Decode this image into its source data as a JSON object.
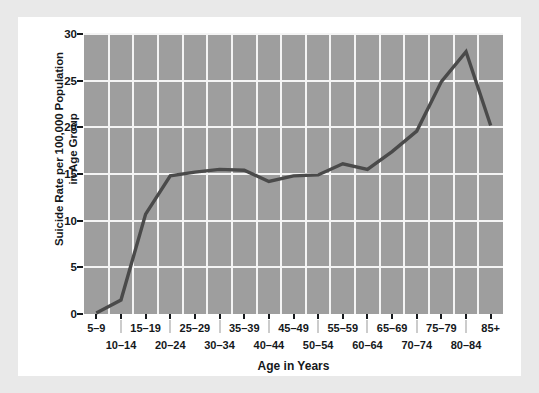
{
  "chart_data": {
    "type": "line",
    "title": "",
    "subtitle": "",
    "xlabel": "Age in Years",
    "ylabel": "Suicide Rate per 100,000 Population\nin Age Group",
    "ylabel_line1": "Suicide Rate per 100,000 Population",
    "ylabel_line2": "in Age Group",
    "categories": [
      "5–9",
      "10–14",
      "15–19",
      "20–24",
      "25–29",
      "30–34",
      "35–39",
      "40–44",
      "45–49",
      "50–54",
      "55–59",
      "60–64",
      "65–69",
      "70–74",
      "75–79",
      "80–84",
      "85+"
    ],
    "values": [
      0.1,
      1.5,
      10.7,
      14.8,
      15.2,
      15.5,
      15.4,
      14.2,
      14.8,
      14.9,
      16.1,
      15.5,
      17.4,
      19.6,
      24.9,
      28.1,
      20.2
    ],
    "series": [
      {
        "name": "Suicide rate",
        "values": [
          0.1,
          1.5,
          10.7,
          14.8,
          15.2,
          15.5,
          15.4,
          14.2,
          14.8,
          14.9,
          16.1,
          15.5,
          17.4,
          19.6,
          24.9,
          28.1,
          20.2
        ]
      }
    ],
    "ylim": [
      0,
      30
    ],
    "yticks": [
      0,
      5,
      10,
      15,
      20,
      25,
      30
    ],
    "ytick_labels": [
      "0",
      "5",
      "10",
      "15",
      "20",
      "25",
      "30"
    ],
    "grid": true,
    "grid_color": "#f4f4f4",
    "legend": false,
    "legend_position": "none",
    "plot_background": "#9e9e9e",
    "line_color": "#4a4a4a",
    "axis_color": "#15181b",
    "canvas_background": "#ffffff",
    "page_background": "#e9e9e9"
  },
  "axis": {
    "y_title_line1": "Suicide Rate per 100,000 Population",
    "y_title_line2": "in Age Group",
    "x_title": "Age in Years"
  }
}
